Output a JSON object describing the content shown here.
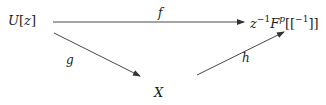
{
  "diagram": {
    "type": "commutative-diagram",
    "nodes": {
      "source": {
        "base": "U",
        "open": "[",
        "var": "z",
        "close": "]"
      },
      "target": {
        "z": "z",
        "z_exp": "−1",
        "F": "F",
        "F_exp": "p",
        "brackets_open": "[[",
        "inner_exp": "−1",
        "brackets_close": "]]"
      },
      "middle": {
        "label": "X"
      }
    },
    "edges": [
      {
        "id": "f",
        "label": "f",
        "from": "source",
        "to": "target"
      },
      {
        "id": "g",
        "label": "g",
        "from": "source",
        "to": "middle"
      },
      {
        "id": "h",
        "label": "h",
        "from": "middle",
        "to": "target"
      }
    ],
    "colors": {
      "line": "#333333",
      "text": "#1a1a1a"
    }
  }
}
